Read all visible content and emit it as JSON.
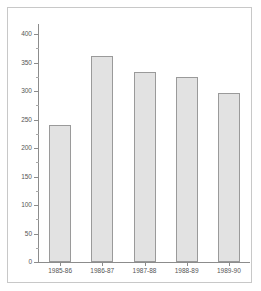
{
  "chart_data": {
    "type": "bar",
    "title": "",
    "subtitle": "",
    "xlabel": "",
    "ylabel": "",
    "categories": [
      "1985-86",
      "1986-87",
      "1987-88",
      "1988-89",
      "1989-90"
    ],
    "values": [
      240,
      362,
      333,
      324,
      296
    ],
    "series": [
      {
        "name": "",
        "values": [
          240,
          362,
          333,
          324,
          296
        ]
      }
    ],
    "ylim": [
      0,
      410
    ],
    "ytick_labels": [
      "0",
      "50",
      "100",
      "150",
      "200",
      "250",
      "300",
      "350",
      "400"
    ],
    "ytick_values": [
      0,
      50,
      100,
      150,
      200,
      250,
      300,
      350,
      400
    ],
    "yminor_values": [
      25,
      75,
      125,
      175,
      225,
      275,
      325,
      375
    ],
    "grid": false,
    "legend": false,
    "legend_position": "none",
    "annotations": [],
    "colors": {
      "bar_fill": "#e2e2e2",
      "bar_border": "#9a9a9a",
      "axis": "#8c8c8c",
      "tick_text": "#555555",
      "frame": "#c8c8c8",
      "background": "#ffffff"
    }
  }
}
